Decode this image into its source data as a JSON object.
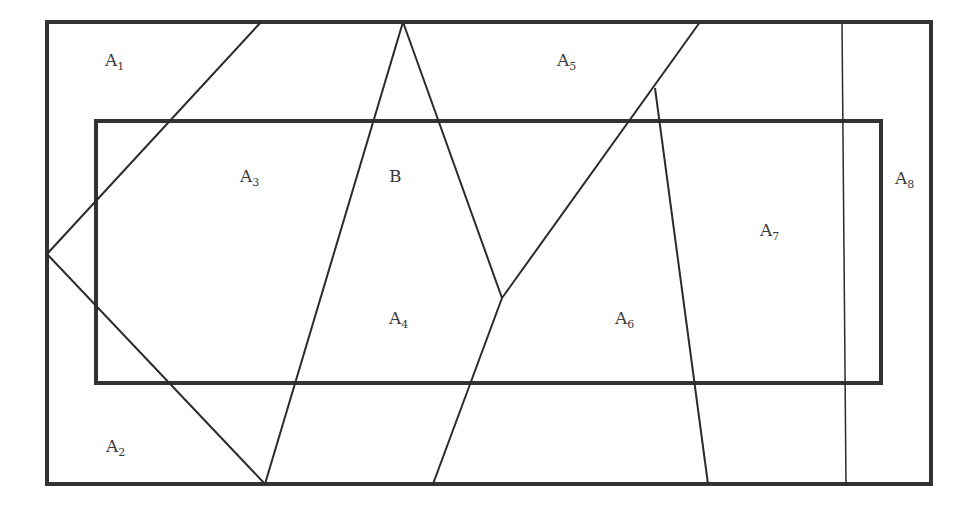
{
  "diagram": {
    "title": "",
    "outer_set_label": "",
    "inner_set": {
      "name": "B"
    },
    "regions": [
      {
        "id": "A1",
        "base": "A",
        "sub": "1"
      },
      {
        "id": "A2",
        "base": "A",
        "sub": "2"
      },
      {
        "id": "A3",
        "base": "A",
        "sub": "3"
      },
      {
        "id": "B",
        "base": "B",
        "sub": ""
      },
      {
        "id": "A4",
        "base": "A",
        "sub": "4"
      },
      {
        "id": "A5",
        "base": "A",
        "sub": "5"
      },
      {
        "id": "A6",
        "base": "A",
        "sub": "6"
      },
      {
        "id": "A7",
        "base": "A",
        "sub": "7"
      },
      {
        "id": "A8",
        "base": "A",
        "sub": "8"
      }
    ],
    "colors": {
      "line": "#333333",
      "text": "#3a3a3a",
      "background": "#ffffff"
    }
  }
}
